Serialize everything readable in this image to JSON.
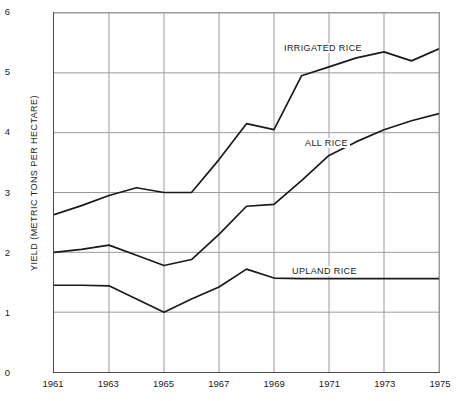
{
  "chart_data": {
    "type": "line",
    "title": "",
    "xlabel": "",
    "ylabel": "YIELD (METRIC TONS PER HECTARE)",
    "xlim": [
      1961,
      1975
    ],
    "ylim": [
      0,
      6
    ],
    "grid": true,
    "legend_position": "inline-annotations",
    "xticks": [
      "1961",
      "1963",
      "1965",
      "1967",
      "1969",
      "1971",
      "1973",
      "1975"
    ],
    "yticks": [
      "0",
      "1",
      "2",
      "3",
      "4",
      "5",
      "6"
    ],
    "x": [
      1961,
      1962,
      1963,
      1964,
      1965,
      1966,
      1967,
      1968,
      1969,
      1970,
      1971,
      1972,
      1973,
      1974,
      1975
    ],
    "series": [
      {
        "name": "IRRIGATED RICE",
        "color": "#1a1a1a",
        "label_x": 282,
        "label_y": 43,
        "values": [
          2.63,
          2.78,
          2.95,
          3.08,
          3.0,
          3.0,
          3.55,
          4.15,
          4.05,
          4.95,
          5.1,
          5.25,
          5.35,
          5.2,
          5.4
        ]
      },
      {
        "name": "ALL RICE",
        "color": "#1a1a1a",
        "label_x": 303,
        "label_y": 138,
        "values": [
          2.0,
          2.05,
          2.12,
          1.95,
          1.78,
          1.88,
          2.3,
          2.77,
          2.8,
          3.2,
          3.62,
          3.85,
          4.05,
          4.2,
          4.32
        ]
      },
      {
        "name": "UPLAND RICE",
        "color": "#1a1a1a",
        "label_x": 290,
        "label_y": 266,
        "values": [
          1.45,
          1.45,
          1.44,
          1.22,
          1.0,
          1.22,
          1.42,
          1.72,
          1.57,
          1.56,
          1.56,
          1.56,
          1.56,
          1.56,
          1.56
        ]
      }
    ]
  }
}
